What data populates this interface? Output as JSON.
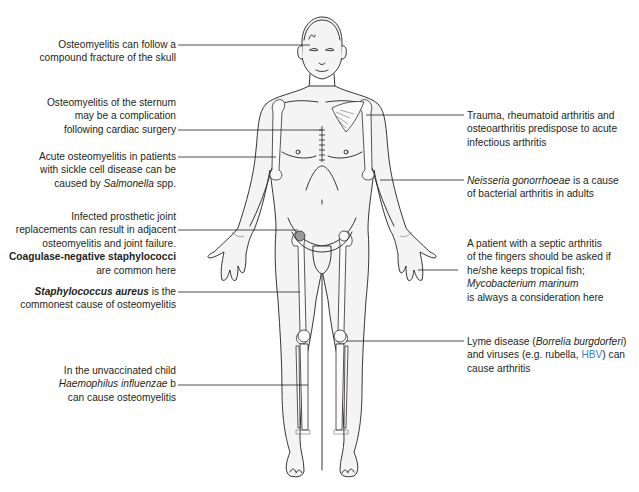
{
  "figure": {
    "highlight_color": "#3d7fc4"
  },
  "annotations_left": [
    {
      "id": "skull",
      "lines": [
        [
          {
            "t": "Osteomyelitis can follow a"
          }
        ],
        [
          {
            "t": "compound fracture of the skull"
          }
        ]
      ]
    },
    {
      "id": "sternum",
      "lines": [
        [
          {
            "t": "Osteomyelitis of the sternum"
          }
        ],
        [
          {
            "t": "may be a complication"
          }
        ],
        [
          {
            "t": "following cardiac surgery"
          }
        ]
      ]
    },
    {
      "id": "sickle-cell",
      "lines": [
        [
          {
            "t": "Acute osteomyelitis in patients"
          }
        ],
        [
          {
            "t": "with sickle cell disease can be"
          }
        ],
        [
          {
            "t": "caused by "
          },
          {
            "t": "Salmonella",
            "i": true
          },
          {
            "t": " spp."
          }
        ]
      ]
    },
    {
      "id": "prosthetic-joint",
      "lines": [
        [
          {
            "t": "Infected prosthetic joint"
          }
        ],
        [
          {
            "t": "replacements can result in adjacent"
          }
        ],
        [
          {
            "t": "osteomyelitis and joint failure."
          }
        ],
        [
          {
            "t": "Coagulase-negative staphylococci",
            "b": true
          }
        ],
        [
          {
            "t": "are common here"
          }
        ]
      ]
    },
    {
      "id": "staph-aureus",
      "lines": [
        [
          {
            "t": "Staphylococcus aureus",
            "b": true,
            "i": true
          },
          {
            "t": " is the"
          }
        ],
        [
          {
            "t": "commonest cause of osteomyelitis"
          }
        ]
      ]
    },
    {
      "id": "haemophilus",
      "lines": [
        [
          {
            "t": "In the unvaccinated child"
          }
        ],
        [
          {
            "t": "Haemophilus influenzae",
            "i": true
          },
          {
            "t": " b"
          }
        ],
        [
          {
            "t": "can cause osteomyelitis"
          }
        ]
      ]
    }
  ],
  "annotations_right": [
    {
      "id": "shoulder",
      "lines": [
        [
          {
            "t": "Trauma, rheumatoid arthritis and"
          }
        ],
        [
          {
            "t": "osteoarthritis predispose to acute"
          }
        ],
        [
          {
            "t": "infectious arthritis"
          }
        ]
      ]
    },
    {
      "id": "gonorrhoeae",
      "lines": [
        [
          {
            "t": "Neisseria gonorrhoeae",
            "i": true
          },
          {
            "t": " is a cause"
          }
        ],
        [
          {
            "t": "of bacterial arthritis in adults"
          }
        ]
      ]
    },
    {
      "id": "fingers",
      "lines": [
        [
          {
            "t": "A patient with a septic arthritis"
          }
        ],
        [
          {
            "t": "of the fingers should be asked if"
          }
        ],
        [
          {
            "t": "he/she keeps tropical fish;"
          }
        ],
        [
          {
            "t": "Mycobacterium marinum",
            "i": true
          }
        ],
        [
          {
            "t": "is always a consideration here"
          }
        ]
      ]
    },
    {
      "id": "lyme",
      "lines": [
        [
          {
            "t": "Lyme disease ("
          },
          {
            "t": "Borrelia burgdorferi",
            "i": true
          },
          {
            "t": ")"
          }
        ],
        [
          {
            "t": "and viruses (e.g. rubella, "
          },
          {
            "t": "HBV",
            "hl": true
          },
          {
            "t": ") can"
          }
        ],
        [
          {
            "t": "cause arthritis"
          }
        ]
      ]
    }
  ]
}
